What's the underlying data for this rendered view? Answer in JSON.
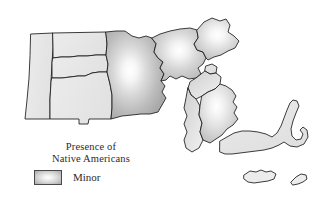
{
  "figure": {
    "background_color": "#ffffff"
  },
  "legend": {
    "title_line1": "Presence of",
    "title_line2": "Native Americans",
    "entries": [
      {
        "label": "Minor",
        "swatch_center_color": "#ffffff",
        "swatch_edge_color": "#a8a8a8",
        "swatch_border_color": "#4a4a4a"
      }
    ]
  },
  "map": {
    "outline_color": "#1a1a1a",
    "base_fill": "#e9e9e9",
    "hotspot_center_color": "#ffffff",
    "hotspot_edge_color": "#b0b0b0",
    "regions": [
      {
        "name": "berkshire",
        "hotspot": false
      },
      {
        "name": "franklin",
        "hotspot": false
      },
      {
        "name": "hampshire",
        "hotspot": false
      },
      {
        "name": "hampden",
        "hotspot": false
      },
      {
        "name": "worcester",
        "hotspot": true
      },
      {
        "name": "middlesex",
        "hotspot": true
      },
      {
        "name": "essex",
        "hotspot": true
      },
      {
        "name": "suffolk",
        "hotspot": false
      },
      {
        "name": "norfolk",
        "hotspot": false
      },
      {
        "name": "bristol",
        "hotspot": false
      },
      {
        "name": "plymouth",
        "hotspot": true
      },
      {
        "name": "barnstable-cape-cod",
        "hotspot": false
      },
      {
        "name": "dukes-marthas-vineyard",
        "hotspot": false
      },
      {
        "name": "nantucket",
        "hotspot": false
      }
    ]
  }
}
